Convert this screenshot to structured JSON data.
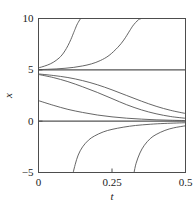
{
  "figure": {
    "background_color": "#ffffff",
    "frame_color": "#4d4d4d",
    "curve_color": "#555555"
  },
  "chart_data": {
    "type": "line",
    "title": "",
    "xlabel": "t",
    "ylabel": "x",
    "xlim": [
      0,
      0.5
    ],
    "ylim": [
      -5,
      10
    ],
    "xticks": [
      0,
      0.25,
      0.5
    ],
    "xticklabels": [
      "0",
      "0.25",
      "0.5"
    ],
    "yticks": [
      -5,
      0,
      5,
      10
    ],
    "yticklabels": [
      "-5",
      "0",
      "5",
      "10"
    ],
    "grid": false,
    "legend": false,
    "series": [
      {
        "name": "blowup-upper-1",
        "x": [
          0.0,
          0.01,
          0.02,
          0.03,
          0.04,
          0.05,
          0.06,
          0.07,
          0.08,
          0.09,
          0.1,
          0.11,
          0.12,
          0.125,
          0.13,
          0.135,
          0.14,
          0.1435
        ],
        "values": [
          5.2,
          5.27,
          5.36,
          5.46,
          5.58,
          5.73,
          5.92,
          6.15,
          6.45,
          6.85,
          7.35,
          7.95,
          8.65,
          9.0,
          9.35,
          9.62,
          9.86,
          10.0
        ]
      },
      {
        "name": "blowup-upper-2",
        "x": [
          0.0,
          0.03,
          0.06,
          0.09,
          0.12,
          0.15,
          0.18,
          0.21,
          0.24,
          0.27,
          0.29,
          0.31,
          0.32,
          0.33,
          0.34,
          0.345,
          0.35
        ],
        "values": [
          5.02,
          5.05,
          5.09,
          5.15,
          5.24,
          5.38,
          5.58,
          5.9,
          6.4,
          7.2,
          7.9,
          8.8,
          9.25,
          9.6,
          9.88,
          9.95,
          10.0
        ]
      },
      {
        "name": "equilibrium-upper",
        "x": [
          0.0,
          0.5
        ],
        "values": [
          5.0,
          5.0
        ]
      },
      {
        "name": "decay-from-4p6",
        "x": [
          0.0,
          0.05,
          0.1,
          0.15,
          0.2,
          0.25,
          0.3,
          0.35,
          0.4,
          0.45,
          0.5
        ],
        "values": [
          4.6,
          4.45,
          4.25,
          3.95,
          3.55,
          3.05,
          2.5,
          1.95,
          1.45,
          1.05,
          0.75
        ]
      },
      {
        "name": "decay-from-4p55",
        "x": [
          0.0,
          0.05,
          0.1,
          0.15,
          0.2,
          0.25,
          0.3,
          0.35,
          0.4,
          0.45,
          0.5
        ],
        "values": [
          4.55,
          4.25,
          3.85,
          3.35,
          2.8,
          2.2,
          1.6,
          1.1,
          0.72,
          0.45,
          0.28
        ]
      },
      {
        "name": "decay-from-2",
        "x": [
          0.0,
          0.05,
          0.1,
          0.15,
          0.2,
          0.25,
          0.3,
          0.35,
          0.4,
          0.45,
          0.5
        ],
        "values": [
          2.0,
          1.55,
          1.15,
          0.85,
          0.6,
          0.42,
          0.29,
          0.2,
          0.13,
          0.09,
          0.06
        ]
      },
      {
        "name": "equilibrium-lower",
        "x": [
          0.0,
          0.5
        ],
        "values": [
          0.0,
          0.0
        ]
      },
      {
        "name": "blowdown-1",
        "x": [
          0.118,
          0.125,
          0.135,
          0.15,
          0.17,
          0.19,
          0.22,
          0.25,
          0.29,
          0.33,
          0.38,
          0.43,
          0.5
        ],
        "values": [
          -5.0,
          -4.2,
          -3.3,
          -2.5,
          -1.85,
          -1.45,
          -1.05,
          -0.8,
          -0.58,
          -0.42,
          -0.3,
          -0.22,
          -0.15
        ]
      },
      {
        "name": "blowdown-2",
        "x": [
          0.325,
          0.332,
          0.345,
          0.36,
          0.38,
          0.4,
          0.43,
          0.46,
          0.5
        ],
        "values": [
          -5.0,
          -4.1,
          -3.1,
          -2.35,
          -1.7,
          -1.3,
          -0.9,
          -0.65,
          -0.45
        ]
      }
    ]
  }
}
